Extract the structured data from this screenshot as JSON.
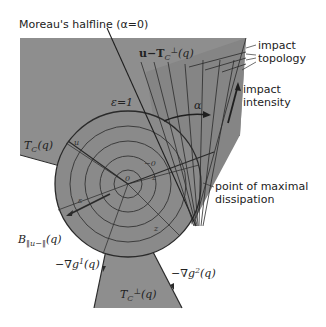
{
  "colors": {
    "region_fill": "#8e8e8e",
    "dark_fill": "#7a7a7a",
    "line": "#2a2a2a",
    "background": "#ffffff"
  },
  "labels": {
    "moreau": "Moreau's halfline (α=0)",
    "tangent_normal_shift": "u−T",
    "tangent_normal_shift_sub": "C",
    "tangent_normal_shift_sup": "⊥",
    "tangent_normal_shift_tail": "(q)",
    "impact_topology_1": "impact",
    "impact_topology_2": "topology",
    "impact_intensity_1": "impact",
    "impact_intensity_2": "intensity",
    "epsilon": "ε=1",
    "alpha": "α",
    "tangent_cone": "T",
    "tangent_cone_sub": "C",
    "tangent_cone_tail": "(q)",
    "u_label": "u",
    "point_max_1": "point of maximal",
    "point_max_2": "dissipation",
    "ball": "B",
    "ball_sub": "‖u−‖",
    "ball_tail": "(q)",
    "grad1": "−∇g",
    "grad1_sup": "1",
    "grad1_tail": "(q)",
    "grad2": "−∇g",
    "grad2_sup": "2",
    "grad2_tail": "(q)",
    "normal_cone": "T",
    "normal_cone_sub": "C",
    "normal_cone_sup": "⊥",
    "normal_cone_tail": "(q)",
    "zero": "0",
    "minus_zero": "−0",
    "z_label": "z",
    "e_label": "ε"
  }
}
